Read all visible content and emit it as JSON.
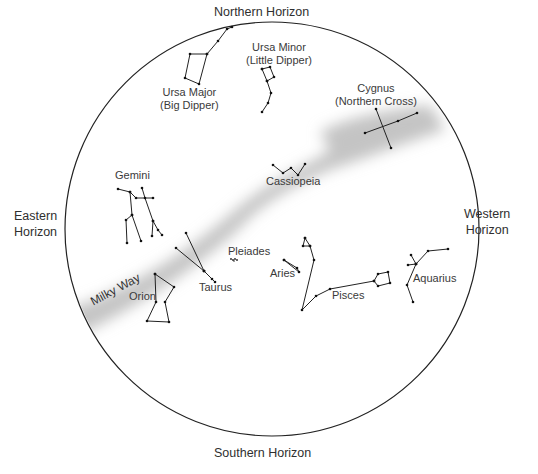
{
  "horizons": {
    "north": "Northern Horizon",
    "south": "Southern Horizon",
    "east_line1": "Eastern",
    "east_line2": "Horizon",
    "west_line1": "Western",
    "west_line2": "Horizon"
  },
  "sky": {
    "circle": {
      "cx": 272,
      "cy": 229,
      "r": 207
    },
    "colors": {
      "line": "#222222",
      "milky_way": "#bdbdbd",
      "text": "#333333"
    },
    "milky_way_label": "Milky Way"
  },
  "constellations": {
    "ursa_major": {
      "line1": "Ursa Major",
      "line2": "(Big Dipper)"
    },
    "ursa_minor": {
      "line1": "Ursa Minor",
      "line2": "(Little Dipper)"
    },
    "cygnus": {
      "line1": "Cygnus",
      "line2": "(Northern Cross)"
    },
    "cassiopeia": {
      "label": "Cassiopeia"
    },
    "gemini": {
      "label": "Gemini"
    },
    "taurus": {
      "label": "Taurus"
    },
    "pleiades": {
      "label": "Pleiades"
    },
    "orion": {
      "label": "Orion"
    },
    "aries": {
      "label": "Aries"
    },
    "pisces": {
      "label": "Pisces"
    },
    "aquarius": {
      "label": "Aquarius"
    }
  },
  "figures": {
    "ursa_major": [
      [
        [
          232,
          27
        ],
        [
          227,
          29
        ],
        [
          218,
          41
        ],
        [
          207,
          54
        ],
        [
          190,
          54
        ],
        [
          185,
          78
        ],
        [
          199,
          84
        ],
        [
          207,
          54
        ]
      ]
    ],
    "ursa_minor": [
      [
        [
          262,
          69
        ],
        [
          270,
          67
        ],
        [
          274,
          77
        ],
        [
          267,
          81
        ],
        [
          262,
          69
        ]
      ],
      [
        [
          267,
          81
        ],
        [
          271,
          93
        ],
        [
          268,
          103
        ],
        [
          262,
          112
        ]
      ]
    ],
    "cygnus": [
      [
        [
          376,
          109
        ],
        [
          391,
          148
        ]
      ],
      [
        [
          365,
          133
        ],
        [
          398,
          121
        ],
        [
          417,
          113
        ]
      ]
    ],
    "cassiopeia": [
      [
        [
          273,
          165
        ],
        [
          283,
          173
        ],
        [
          291,
          168
        ],
        [
          298,
          175
        ],
        [
          305,
          164
        ]
      ]
    ],
    "gemini": [
      [
        [
          118,
          189
        ],
        [
          130,
          192
        ],
        [
          136,
          198
        ],
        [
          153,
          198
        ]
      ],
      [
        [
          130,
          192
        ],
        [
          132,
          215
        ],
        [
          126,
          220
        ],
        [
          127,
          243
        ]
      ],
      [
        [
          132,
          215
        ],
        [
          141,
          241
        ]
      ],
      [
        [
          142,
          188
        ],
        [
          145,
          198
        ],
        [
          153,
          221
        ],
        [
          152,
          236
        ]
      ],
      [
        [
          153,
          221
        ],
        [
          158,
          230
        ],
        [
          162,
          235
        ]
      ]
    ],
    "taurus": [
      [
        [
          186,
          233
        ],
        [
          204,
          271
        ],
        [
          212,
          279
        ]
      ],
      [
        [
          176,
          248
        ],
        [
          204,
          271
        ]
      ],
      [
        [
          204,
          271
        ],
        [
          215,
          282
        ]
      ]
    ],
    "orion": [
      [
        [
          155,
          274
        ],
        [
          156,
          302
        ],
        [
          147,
          321
        ],
        [
          169,
          322
        ],
        [
          165,
          302
        ],
        [
          174,
          287
        ],
        [
          155,
          274
        ]
      ]
    ],
    "aries": [
      [
        [
          284,
          260
        ],
        [
          299,
          272
        ],
        [
          297,
          268
        ],
        [
          284,
          260
        ]
      ]
    ],
    "pisces": [
      [
        [
          305,
          238
        ],
        [
          310,
          246
        ],
        [
          314,
          260
        ],
        [
          302,
          310
        ],
        [
          316,
          296
        ],
        [
          330,
          289
        ],
        [
          374,
          281
        ],
        [
          378,
          274
        ],
        [
          388,
          272
        ],
        [
          390,
          283
        ],
        [
          378,
          286
        ],
        [
          374,
          281
        ]
      ],
      [
        [
          305,
          238
        ],
        [
          303,
          246
        ],
        [
          310,
          246
        ]
      ]
    ],
    "aquarius": [
      [
        [
          411,
          255
        ],
        [
          416,
          264
        ],
        [
          428,
          251
        ],
        [
          448,
          249
        ]
      ],
      [
        [
          408,
          265
        ],
        [
          416,
          264
        ]
      ],
      [
        [
          416,
          264
        ],
        [
          407,
          285
        ],
        [
          413,
          302
        ]
      ]
    ]
  }
}
